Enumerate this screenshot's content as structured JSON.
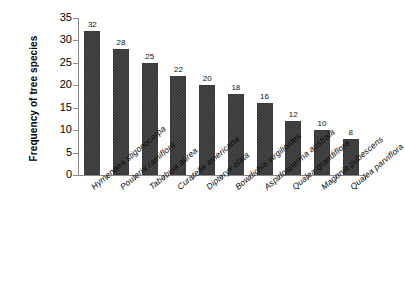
{
  "chart_data": {
    "type": "bar",
    "title": "",
    "xlabel": "",
    "ylabel": "Frequency of tree species",
    "ylim": [
      0,
      35
    ],
    "yticks": [
      0,
      5,
      10,
      15,
      20,
      25,
      30,
      35
    ],
    "grid": false,
    "legend": false,
    "bar_color": "#4a4a4a",
    "show_value_labels": true,
    "categories": [
      "Hymenaea stigonocarpa",
      "Pouteria ramiflora",
      "Tabebuia aurea",
      "Curatella  americana",
      "Dipteryx alata",
      "Bowdichia virgilioides",
      "Aspidosperma australa",
      "Qualea grandiflora",
      "Magonia pubescens",
      "Qualea parviflora"
    ],
    "values": [
      32,
      28,
      25,
      22,
      20,
      18,
      16,
      12,
      10,
      8
    ],
    "value_labels": [
      "32",
      "28",
      "25",
      "22",
      "20",
      "18",
      "16",
      "12",
      "10",
      "8"
    ],
    "ytick_labels": [
      "0",
      "5",
      "10",
      "15",
      "20",
      "25",
      "30",
      "35"
    ]
  }
}
